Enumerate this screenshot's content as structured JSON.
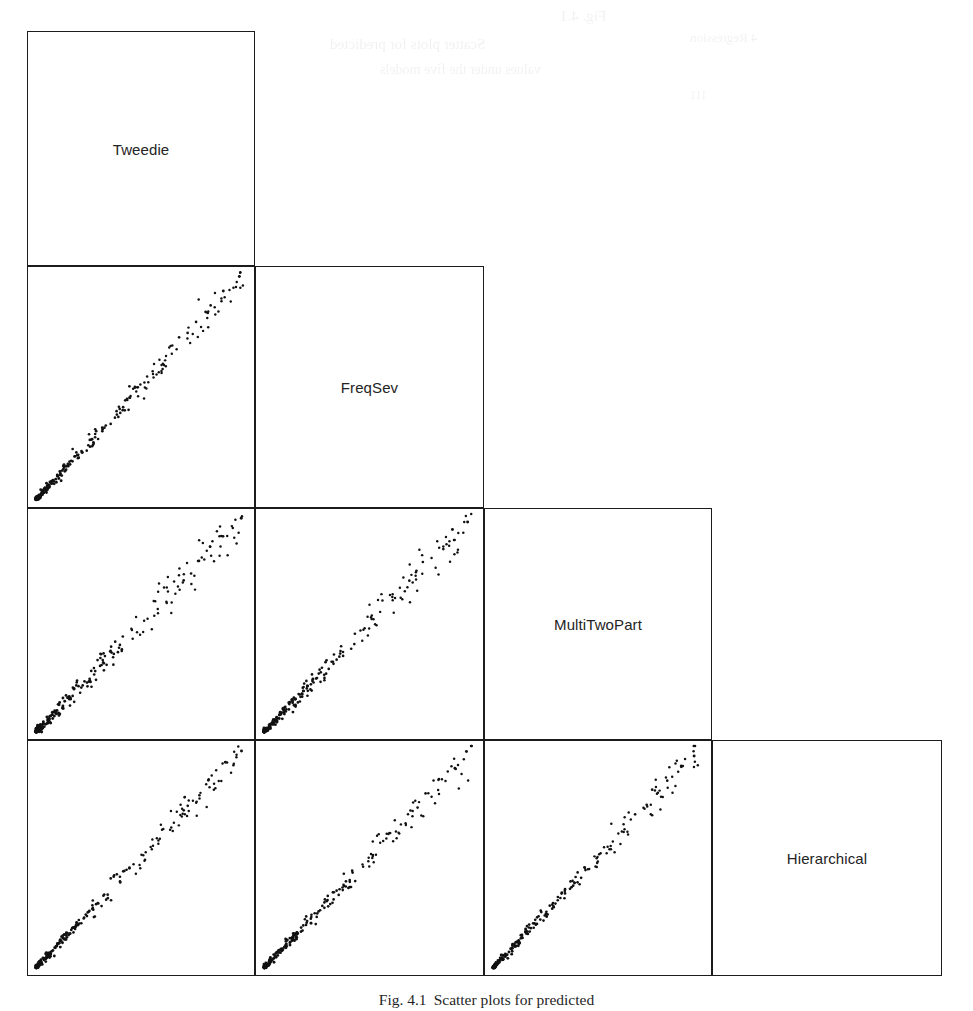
{
  "figure": {
    "kind": "scatterplot-matrix",
    "caption_number": "Fig. 4.1",
    "caption_text": "Scatter plots for predicted",
    "background_color": "#ffffff",
    "frame_color": "#1c1c1c",
    "point_color": "#111111"
  },
  "artifacts": {
    "note": "faint scanner bleed-through marks along the top margin",
    "marks": [
      {
        "text": "Fig. 4.1",
        "x": 560,
        "y": 8,
        "size": 15,
        "rotate": 0
      },
      {
        "text": "Scatter plots for predicted",
        "x": 330,
        "y": 36,
        "size": 15,
        "rotate": 0
      },
      {
        "text": "values under the five models",
        "x": 380,
        "y": 62,
        "size": 14,
        "rotate": 0
      },
      {
        "text": "4 Regression",
        "x": 690,
        "y": 30,
        "size": 13,
        "rotate": 0
      },
      {
        "text": "111",
        "x": 690,
        "y": 88,
        "size": 12,
        "rotate": 0
      }
    ]
  },
  "matrix": {
    "variables": [
      "Tweedie",
      "FreqSev",
      "MultiTwoPart",
      "Hierarchical"
    ],
    "n_rows": 4,
    "n_cols": 4,
    "triangle": "lower",
    "column_edges_px": [
      27,
      255,
      484,
      712,
      942
    ],
    "row_edges_px": [
      31,
      266,
      508,
      740,
      976
    ],
    "diagonal_labels": [
      {
        "row": 0,
        "col": 0,
        "label": "Tweedie"
      },
      {
        "row": 1,
        "col": 1,
        "label": "FreqSev"
      },
      {
        "row": 2,
        "col": 2,
        "label": "MultiTwoPart"
      },
      {
        "row": 3,
        "col": 3,
        "label": "Hierarchical"
      }
    ],
    "scatter_panels": [
      {
        "row": 1,
        "col": 0,
        "x_var": "Tweedie",
        "y_var": "FreqSev",
        "seed": 11,
        "n_points": 230,
        "spread": 0.03
      },
      {
        "row": 2,
        "col": 0,
        "x_var": "Tweedie",
        "y_var": "MultiTwoPart",
        "seed": 23,
        "n_points": 230,
        "spread": 0.042
      },
      {
        "row": 2,
        "col": 1,
        "x_var": "FreqSev",
        "y_var": "MultiTwoPart",
        "seed": 37,
        "n_points": 230,
        "spread": 0.036
      },
      {
        "row": 3,
        "col": 0,
        "x_var": "Tweedie",
        "y_var": "Hierarchical",
        "seed": 51,
        "n_points": 230,
        "spread": 0.028
      },
      {
        "row": 3,
        "col": 1,
        "x_var": "FreqSev",
        "y_var": "Hierarchical",
        "seed": 67,
        "n_points": 230,
        "spread": 0.031
      },
      {
        "row": 3,
        "col": 2,
        "x_var": "MultiTwoPart",
        "y_var": "Hierarchical",
        "seed": 83,
        "n_points": 230,
        "spread": 0.026
      }
    ]
  },
  "chart_data": {
    "type": "scatter",
    "title": "",
    "subtitle": "",
    "xlabel": "",
    "ylabel": "",
    "grid": false,
    "legend": "none",
    "layout": "scatterplot matrix (pairs plot), lower triangle only; diagonal cells hold variable names",
    "variables": [
      "Tweedie",
      "FreqSev",
      "MultiTwoPart",
      "Hierarchical"
    ],
    "axis_ticks": {
      "x": [],
      "y": []
    },
    "xlim": [
      0,
      1
    ],
    "ylim": [
      0,
      1
    ],
    "series": [
      {
        "name": "FreqSev vs Tweedie",
        "x_var": "Tweedie",
        "y_var": "FreqSev",
        "n": 230,
        "correlation": 0.99,
        "slope": 1.0,
        "intercept": 0.0
      },
      {
        "name": "MultiTwoPart vs Tweedie",
        "x_var": "Tweedie",
        "y_var": "MultiTwoPart",
        "n": 230,
        "correlation": 0.98,
        "slope": 1.0,
        "intercept": 0.0
      },
      {
        "name": "MultiTwoPart vs FreqSev",
        "x_var": "FreqSev",
        "y_var": "MultiTwoPart",
        "n": 230,
        "correlation": 0.98,
        "slope": 1.0,
        "intercept": 0.0
      },
      {
        "name": "Hierarchical vs Tweedie",
        "x_var": "Tweedie",
        "y_var": "Hierarchical",
        "n": 230,
        "correlation": 0.99,
        "slope": 1.0,
        "intercept": 0.0
      },
      {
        "name": "Hierarchical vs FreqSev",
        "x_var": "FreqSev",
        "y_var": "Hierarchical",
        "n": 230,
        "correlation": 0.99,
        "slope": 1.0,
        "intercept": 0.0
      },
      {
        "name": "Hierarchical vs MultiTwoPart",
        "x_var": "MultiTwoPart",
        "y_var": "Hierarchical",
        "n": 230,
        "correlation": 0.99,
        "slope": 1.0,
        "intercept": 0.0
      }
    ]
  }
}
